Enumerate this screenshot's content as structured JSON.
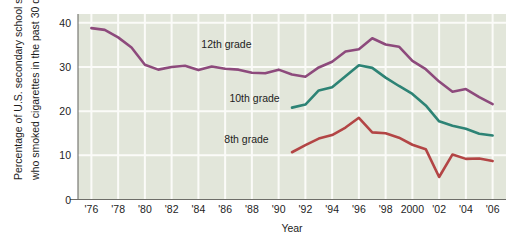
{
  "chart_data": {
    "type": "line",
    "title": "",
    "xlabel": "Year",
    "ylabel": "Percentage of U.S. secondary school students who smoked cigarettes in the past 30 days",
    "ylabel_line1": "Percentage of U.S. secondary school students",
    "ylabel_line2": "who smoked cigarettes in the past 30 days",
    "xlim": [
      1975,
      2007
    ],
    "ylim": [
      0,
      42
    ],
    "yticks": [
      0,
      10,
      20,
      30,
      40
    ],
    "ytick_labels": [
      "0",
      "10",
      "20",
      "30",
      "40"
    ],
    "xticks": [
      1976,
      1978,
      1980,
      1982,
      1984,
      1986,
      1988,
      1990,
      1992,
      1994,
      1996,
      1998,
      2000,
      2002,
      2004,
      2006
    ],
    "xtick_labels": [
      "'76",
      "'78",
      "'80",
      "'82",
      "'84",
      "'86",
      "'88",
      "'90",
      "'92",
      "'94",
      "'96",
      "'98",
      "2000",
      "'02",
      "'04",
      "'06"
    ],
    "grid": true,
    "legend": "inline-annotations",
    "plot_background": "#e2e6da",
    "series": [
      {
        "name": "12th grade",
        "color": "#8d4a7c",
        "label_x": 1986.1,
        "label_y": 34.2,
        "x": [
          1976,
          1977,
          1978,
          1979,
          1980,
          1981,
          1982,
          1983,
          1984,
          1985,
          1986,
          1987,
          1988,
          1989,
          1990,
          1991,
          1992,
          1993,
          1994,
          1995,
          1996,
          1997,
          1998,
          1999,
          2000,
          2001,
          2002,
          2003,
          2004,
          2005,
          2006
        ],
        "values": [
          38.8,
          38.4,
          36.7,
          34.4,
          30.5,
          29.4,
          30.0,
          30.3,
          29.3,
          30.1,
          29.6,
          29.4,
          28.7,
          28.6,
          29.4,
          28.3,
          27.8,
          29.9,
          31.2,
          33.5,
          34.0,
          36.5,
          35.1,
          34.6,
          31.4,
          29.5,
          26.7,
          24.4,
          25.0,
          23.2,
          21.6
        ],
        "series_start_year": 1976
      },
      {
        "name": "10th grade",
        "color": "#2d8375",
        "label_x": 1988.2,
        "label_y": 22.0,
        "x": [
          1991,
          1992,
          1993,
          1994,
          1995,
          1996,
          1997,
          1998,
          1999,
          2000,
          2001,
          2002,
          2003,
          2004,
          2005,
          2006
        ],
        "values": [
          20.8,
          21.5,
          24.7,
          25.4,
          27.9,
          30.4,
          29.8,
          27.6,
          25.7,
          23.9,
          21.3,
          17.7,
          16.7,
          16.0,
          14.9,
          14.5
        ],
        "series_start_year": 1991
      },
      {
        "name": "8th grade",
        "color": "#b34545",
        "label_x": 1987.6,
        "label_y": 12.9,
        "x": [
          1991,
          1992,
          1993,
          1994,
          1995,
          1996,
          1997,
          1998,
          1999,
          2000,
          2001,
          2002,
          2003,
          2004,
          2005,
          2006
        ],
        "values": [
          10.7,
          12.3,
          13.8,
          14.6,
          16.3,
          18.5,
          15.2,
          15.0,
          14.0,
          12.4,
          11.4,
          5.1,
          10.2,
          9.2,
          9.3,
          8.7
        ],
        "series_start_year": 1991
      }
    ]
  }
}
